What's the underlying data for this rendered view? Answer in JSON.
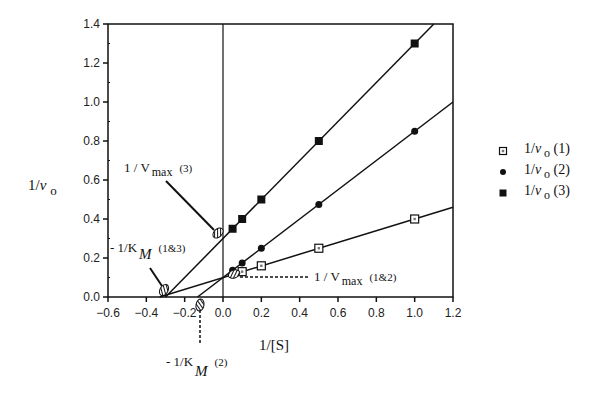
{
  "chart_data": {
    "type": "line",
    "title": "",
    "xlabel": "1/[S]",
    "ylabel": "1/v o",
    "xlim": [
      -0.6,
      1.2
    ],
    "ylim": [
      0.0,
      1.4
    ],
    "x_ticks": [
      "-0.6",
      "-0.4",
      "-0.2",
      "0.0",
      "0.2",
      "0.4",
      "0.6",
      "0.8",
      "1.0",
      "1.2"
    ],
    "y_ticks": [
      "0.0",
      "0.2",
      "0.4",
      "0.6",
      "0.8",
      "1.0",
      "1.2",
      "1.4"
    ],
    "grid": false,
    "legend_position": "right",
    "series": [
      {
        "name": "1/v o (1)",
        "marker": "open-square",
        "x": [
          0.1,
          0.2,
          0.5,
          1.0
        ],
        "y": [
          0.13,
          0.16,
          0.25,
          0.4
        ],
        "fit": {
          "intercept_y": 0.1,
          "slope": 0.3,
          "intercept_x": -0.33
        }
      },
      {
        "name": "1/v o (2)",
        "marker": "filled-diamond",
        "x": [
          0.05,
          0.1,
          0.2,
          0.5,
          1.0
        ],
        "y": [
          0.137,
          0.175,
          0.25,
          0.475,
          0.85
        ],
        "fit": {
          "intercept_y": 0.1,
          "slope": 0.75,
          "intercept_x": -0.133
        }
      },
      {
        "name": "1/v o (3)",
        "marker": "filled-square",
        "x": [
          0.05,
          0.1,
          0.2,
          0.5,
          1.0
        ],
        "y": [
          0.35,
          0.4,
          0.5,
          0.8,
          1.3
        ],
        "fit": {
          "intercept_y": 0.3,
          "slope": 1.0,
          "intercept_x": -0.3
        }
      }
    ],
    "annotations": [
      {
        "text": "1/Vmax (3)",
        "points_to": [
          0.0,
          0.3
        ]
      },
      {
        "text": "- 1/KM (1&3)",
        "points_to": [
          -0.33,
          0.0
        ]
      },
      {
        "text": "1/Vmax (1&2)",
        "points_to": [
          0.0,
          0.1
        ]
      },
      {
        "text": "- 1/KM (2)",
        "points_to": [
          -0.133,
          0.0
        ]
      }
    ]
  },
  "labels": {
    "xlabel": "1/[S]",
    "ylabel_main": "1/",
    "ylabel_v": "v",
    "ylabel_sub": "o",
    "ann_vmax3_main": "1 / V",
    "ann_vmax3_sub": "max",
    "ann_vmax3_tag": "(3)",
    "ann_km13_main": "- 1/K",
    "ann_km13_sub": "M",
    "ann_km13_tag": "(1&3)",
    "ann_vmax12_main": "1 / V",
    "ann_vmax12_sub": "max",
    "ann_vmax12_tag": "(1&2)",
    "ann_km2_main": "- 1/K",
    "ann_km2_sub": "M",
    "ann_km2_tag": "(2)"
  },
  "legend": [
    {
      "prefix": "1/",
      "v": "v",
      "sub": "o",
      "tag": "(1)"
    },
    {
      "prefix": "1/",
      "v": "v",
      "sub": "o",
      "tag": "(2)"
    },
    {
      "prefix": "1/",
      "v": "v",
      "sub": "o",
      "tag": "(3)"
    }
  ]
}
